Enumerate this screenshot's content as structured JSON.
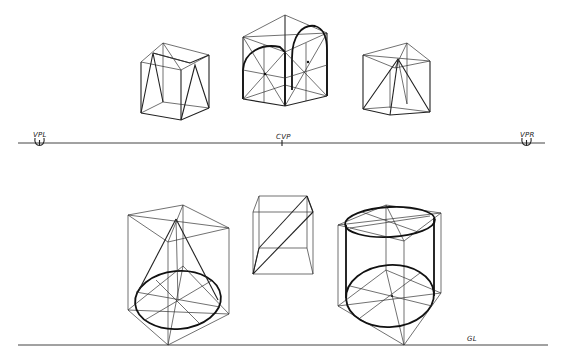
{
  "diagram": {
    "type": "two-point perspective construction drawing",
    "horizon_line": {
      "labels": {
        "left_vanishing_point": "VPL",
        "center_vision_point": "CVP",
        "right_vanishing_point": "VPR"
      }
    },
    "ground_line": {
      "label": "GL"
    },
    "upper_row_objects": [
      {
        "name": "cube-with-inclined-planes",
        "description": "Wireframe cube with triangular inclined faces"
      },
      {
        "name": "cube-with-arches",
        "description": "Wireframe cube with two semicircular arches and diagonal construction lines"
      },
      {
        "name": "cube-with-pyramid",
        "description": "Wireframe cube containing an inscribed pyramid"
      }
    ],
    "lower_row_objects": [
      {
        "name": "cube-with-cone",
        "description": "Wireframe cube with inscribed cone on elliptical base"
      },
      {
        "name": "cube-with-inclined-plane",
        "description": "Small wireframe cube with diagonal inclined slab"
      },
      {
        "name": "cube-with-cylinder",
        "description": "Wireframe cube with inscribed cylinder, top and bottom ellipses"
      }
    ]
  }
}
